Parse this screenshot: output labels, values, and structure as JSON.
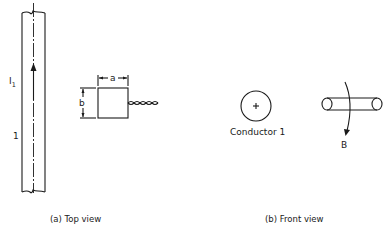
{
  "diagram": {
    "top_view": {
      "caption": "(a) Top view",
      "current_label": "I",
      "current_subscript": "1",
      "conductor_number": "1",
      "loop_width_label": "a",
      "loop_height_label": "b"
    },
    "front_view": {
      "caption": "(b) Front view",
      "conductor_label": "Conductor 1",
      "field_label": "B"
    }
  }
}
